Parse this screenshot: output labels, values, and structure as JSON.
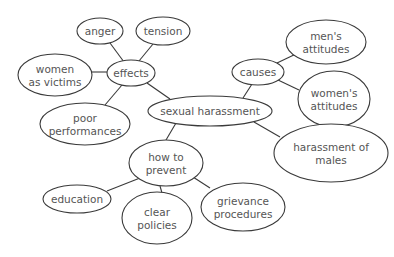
{
  "diagram": {
    "type": "mind-map",
    "central": "sexual_harassment",
    "nodes": {
      "sexual_harassment": {
        "lines": [
          "sexual harassment"
        ],
        "cx": 210,
        "cy": 111,
        "rx": 62,
        "ry": 15
      },
      "effects": {
        "lines": [
          "effects"
        ],
        "cx": 131,
        "cy": 73,
        "rx": 24,
        "ry": 13
      },
      "anger": {
        "lines": [
          "anger"
        ],
        "cx": 100,
        "cy": 31,
        "rx": 23,
        "ry": 13
      },
      "tension": {
        "lines": [
          "tension"
        ],
        "cx": 163,
        "cy": 31,
        "rx": 27,
        "ry": 14
      },
      "women_as_victims": {
        "lines": [
          "women",
          "as victims"
        ],
        "cx": 55,
        "cy": 75,
        "rx": 37,
        "ry": 21
      },
      "poor_performances": {
        "lines": [
          "poor",
          "performances"
        ],
        "cx": 85,
        "cy": 124,
        "rx": 45,
        "ry": 21
      },
      "causes": {
        "lines": [
          "causes"
        ],
        "cx": 258,
        "cy": 72,
        "rx": 26,
        "ry": 13
      },
      "mens_attitudes": {
        "lines": [
          "men's",
          "attitudes"
        ],
        "cx": 326,
        "cy": 42,
        "rx": 40,
        "ry": 22
      },
      "womens_attitudes": {
        "lines": [
          "women's",
          "attitudes"
        ],
        "cx": 334,
        "cy": 99,
        "rx": 36,
        "ry": 28
      },
      "harassment_of_males": {
        "lines": [
          "harassment of",
          "males"
        ],
        "cx": 331,
        "cy": 153,
        "rx": 57,
        "ry": 29
      },
      "how_to_prevent": {
        "lines": [
          "how to",
          "prevent"
        ],
        "cx": 166,
        "cy": 163,
        "rx": 37,
        "ry": 23
      },
      "education": {
        "lines": [
          "education"
        ],
        "cx": 77,
        "cy": 199,
        "rx": 34,
        "ry": 14
      },
      "clear_policies": {
        "lines": [
          "clear",
          "policies"
        ],
        "cx": 157,
        "cy": 218,
        "rx": 35,
        "ry": 26
      },
      "grievance_procedures": {
        "lines": [
          "grievance",
          "procedures"
        ],
        "cx": 243,
        "cy": 207,
        "rx": 42,
        "ry": 24
      }
    },
    "edges": [
      [
        "effects",
        "anger",
        124,
        62,
        110,
        43
      ],
      [
        "effects",
        "tension",
        139,
        61,
        153,
        44
      ],
      [
        "effects",
        "women_as_victims",
        108,
        72,
        92,
        72
      ],
      [
        "effects",
        "poor_performances",
        122,
        85,
        105,
        105
      ],
      [
        "effects",
        "sexual_harassment",
        147,
        83,
        170,
        99
      ],
      [
        "causes",
        "sexual_harassment",
        252,
        84,
        243,
        98
      ],
      [
        "causes",
        "mens_attitudes",
        277,
        63,
        298,
        53
      ],
      [
        "causes",
        "womens_attitudes",
        278,
        80,
        299,
        90
      ],
      [
        "sexual_harassment",
        "harassment_of_males",
        254,
        122,
        280,
        137
      ],
      [
        "sexual_harassment",
        "how_to_prevent",
        176,
        123,
        166,
        140
      ],
      [
        "how_to_prevent",
        "education",
        140,
        178,
        107,
        191
      ],
      [
        "how_to_prevent",
        "clear_policies",
        160,
        186,
        162,
        193
      ],
      [
        "how_to_prevent",
        "grievance_procedures",
        193,
        177,
        210,
        188
      ]
    ]
  }
}
